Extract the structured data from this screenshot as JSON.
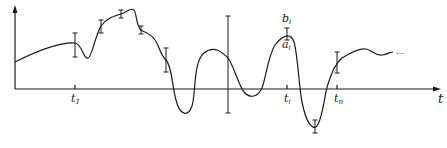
{
  "diagram": {
    "type": "function-with-interval-error-bars",
    "axis": {
      "x_label": "t",
      "origin": [
        15,
        89
      ],
      "x_end": 440,
      "y_top": 8
    },
    "tick_labels": [
      {
        "id": "t1",
        "base": "t",
        "sub": "1",
        "x": 75
      },
      {
        "id": "ti",
        "base": "t",
        "sub": "i",
        "x": 287
      },
      {
        "id": "tn",
        "base": "t",
        "sub": "n",
        "x": 337
      }
    ],
    "bound_labels": {
      "upper": {
        "base": "b",
        "sub": "i"
      },
      "lower": {
        "base": "a",
        "sub": "i"
      }
    },
    "continuation": "...",
    "stroke_color": "#1a1a1a",
    "error_bars": [
      {
        "x": 75,
        "y_top": 33,
        "y_bot": 57
      },
      {
        "x": 101,
        "y_top": 20,
        "y_bot": 33
      },
      {
        "x": 121,
        "y_top": 10,
        "y_bot": 18
      },
      {
        "x": 141,
        "y_top": 26,
        "y_bot": 34
      },
      {
        "x": 166,
        "y_top": 48,
        "y_bot": 72
      },
      {
        "x": 228,
        "y_top": 16,
        "y_bot": 113
      },
      {
        "x": 287,
        "y_top": 28,
        "y_bot": 40
      },
      {
        "x": 315,
        "y_top": 120,
        "y_bot": 133
      },
      {
        "x": 337,
        "y_top": 52,
        "y_bot": 73
      }
    ]
  }
}
